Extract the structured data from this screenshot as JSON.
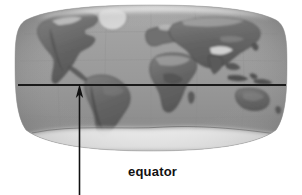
{
  "figure": {
    "kind": "world-map-diagram",
    "projection_label": "Robinson",
    "background_color": "#ffffff",
    "ocean_color": "#9a9a9a",
    "land_color": "#6a6a6a",
    "ice_color": "#e8e8e8",
    "line_color": "#1a1a1a",
    "graticule_color": "#8a8a8a",
    "map_features": [
      "North America",
      "South America",
      "Greenland",
      "Europe",
      "Africa",
      "Asia",
      "Australia",
      "Antarctica"
    ]
  },
  "annotation": {
    "line_name": "equator",
    "label": "equator",
    "arrow_name": "equator-pointer-arrow",
    "arrow_direction": "up"
  }
}
